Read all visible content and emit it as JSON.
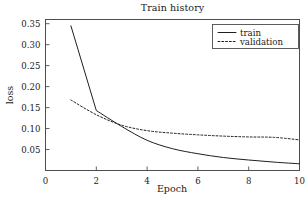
{
  "chart_data": {
    "type": "line",
    "title": "Train history",
    "xlabel": "Epoch",
    "ylabel": "loss",
    "x": [
      1,
      2,
      3,
      4,
      5,
      6,
      7,
      8,
      9,
      10
    ],
    "series": [
      {
        "name": "train",
        "style": "solid",
        "values": [
          0.345,
          0.143,
          0.105,
          0.072,
          0.052,
          0.04,
          0.031,
          0.025,
          0.02,
          0.016
        ]
      },
      {
        "name": "validation",
        "style": "dotted",
        "values": [
          0.168,
          0.133,
          0.108,
          0.095,
          0.089,
          0.085,
          0.082,
          0.08,
          0.079,
          0.073
        ]
      }
    ],
    "xlim": [
      0,
      10
    ],
    "ylim": [
      0.0,
      0.36
    ],
    "xticks": [
      0,
      2,
      4,
      6,
      8,
      10
    ],
    "xtick_labels": [
      "0",
      "2",
      "4",
      "6",
      "8",
      "10"
    ],
    "yticks": [
      0.05,
      0.1,
      0.15,
      0.2,
      0.25,
      0.3,
      0.35
    ],
    "ytick_labels": [
      "0.05",
      "0.10",
      "0.15",
      "0.20",
      "0.25",
      "0.30",
      "0.35"
    ],
    "grid": false,
    "legend_position": "upper right",
    "legend_entries": [
      "train",
      "validation"
    ],
    "line_color": "#1f1f1f",
    "axes_color": "#4d4d4d",
    "background": "#ffffff"
  }
}
